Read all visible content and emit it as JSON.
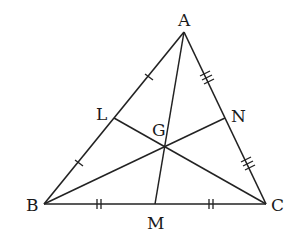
{
  "diagram": {
    "type": "triangle-medians-centroid",
    "vertices": {
      "A": {
        "label": "A",
        "x": 184,
        "y": 32
      },
      "B": {
        "label": "B",
        "x": 44,
        "y": 204
      },
      "C": {
        "label": "C",
        "x": 266,
        "y": 204
      }
    },
    "midpoints": {
      "L": {
        "label": "L",
        "on": "AB"
      },
      "M": {
        "label": "M",
        "on": "BC"
      },
      "N": {
        "label": "N",
        "on": "AC"
      }
    },
    "centroid": {
      "label": "G"
    },
    "medians": [
      "AM",
      "BN",
      "CL"
    ],
    "tick_marks": {
      "AB": {
        "marks": 1,
        "segments": [
          "AL",
          "LB"
        ]
      },
      "BC": {
        "marks": 2,
        "segments": [
          "BM",
          "MC"
        ]
      },
      "AC": {
        "marks": 3,
        "segments": [
          "AN",
          "NC"
        ]
      }
    },
    "colors": {
      "stroke": "#222222",
      "label": "#1a1a1a",
      "background": "#ffffff"
    }
  },
  "labels": {
    "A": "A",
    "B": "B",
    "C": "C",
    "L": "L",
    "M": "M",
    "N": "N",
    "G": "G"
  }
}
